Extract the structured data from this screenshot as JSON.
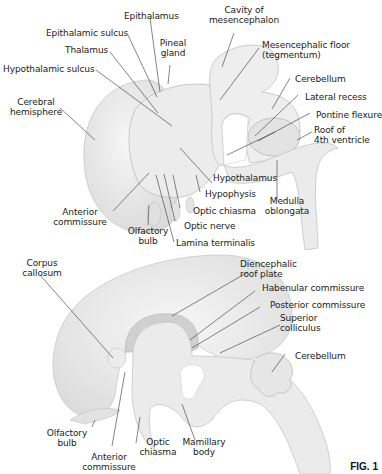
{
  "figure_number": "FIG. 1",
  "top_diagram": {
    "labels": [
      {
        "id": "epithalamus",
        "text": "Epithalamus"
      },
      {
        "id": "epithalamic_sulcus",
        "text": "Epithalamic sulcus"
      },
      {
        "id": "pineal_gland_1",
        "text": "Pineal"
      },
      {
        "id": "pineal_gland_2",
        "text": "gland"
      },
      {
        "id": "thalamus",
        "text": "Thalamus"
      },
      {
        "id": "hypothalamic_sulcus",
        "text": "Hypothalamic sulcus"
      },
      {
        "id": "cerebral_hemisphere_1",
        "text": "Cerebral"
      },
      {
        "id": "cerebral_hemisphere_2",
        "text": "hemisphere"
      },
      {
        "id": "cavity_mesencephalon_1",
        "text": "Cavity of"
      },
      {
        "id": "cavity_mesencephalon_2",
        "text": "mesencephalon"
      },
      {
        "id": "mesencephalic_floor_1",
        "text": "Mesencephalic floor"
      },
      {
        "id": "mesencephalic_floor_2",
        "text": "(tegmentum)"
      },
      {
        "id": "cerebellum",
        "text": "Cerebellum"
      },
      {
        "id": "lateral_recess",
        "text": "Lateral recess"
      },
      {
        "id": "pontine_flexure",
        "text": "Pontine flexure"
      },
      {
        "id": "roof_4th_1",
        "text": "Roof of"
      },
      {
        "id": "roof_4th_2",
        "text": "4th ventricle"
      },
      {
        "id": "hypothalamus",
        "text": "Hypothalamus"
      },
      {
        "id": "hypophysis",
        "text": "Hypophysis"
      },
      {
        "id": "medulla_1",
        "text": "Medulla"
      },
      {
        "id": "medulla_2",
        "text": "oblongata"
      },
      {
        "id": "optic_chiasma",
        "text": "Optic chiasma"
      },
      {
        "id": "optic_nerve",
        "text": "Optic nerve"
      },
      {
        "id": "anterior_commissure_1",
        "text": "Anterior"
      },
      {
        "id": "anterior_commissure_2",
        "text": "commissure"
      },
      {
        "id": "olfactory_bulb_1",
        "text": "Olfactory"
      },
      {
        "id": "olfactory_bulb_2",
        "text": "bulb"
      },
      {
        "id": "lamina_terminalis",
        "text": "Lamina terminalis"
      }
    ]
  },
  "bottom_diagram": {
    "labels": [
      {
        "id": "corpus_callosum_1",
        "text": "Corpus"
      },
      {
        "id": "corpus_callosum_2",
        "text": "callosum"
      },
      {
        "id": "diencephalic_roof_1",
        "text": "Diencephalic"
      },
      {
        "id": "diencephalic_roof_2",
        "text": "roof plate"
      },
      {
        "id": "habenular_commissure",
        "text": "Habenular commissure"
      },
      {
        "id": "posterior_commissure",
        "text": "Posterior commissure"
      },
      {
        "id": "superior_colliculus_1",
        "text": "Superior"
      },
      {
        "id": "superior_colliculus_2",
        "text": "colliculus"
      },
      {
        "id": "cerebellum",
        "text": "Cerebellum"
      },
      {
        "id": "olfactory_bulb_1",
        "text": "Olfactory"
      },
      {
        "id": "olfactory_bulb_2",
        "text": "bulb"
      },
      {
        "id": "anterior_commissure_1",
        "text": "Anterior"
      },
      {
        "id": "anterior_commissure_2",
        "text": "commissure"
      },
      {
        "id": "optic_chiasma_1",
        "text": "Optic"
      },
      {
        "id": "optic_chiasma_2",
        "text": "chiasma"
      },
      {
        "id": "mamillary_body_1",
        "text": "Mamillary"
      },
      {
        "id": "mamillary_body_2",
        "text": "body"
      }
    ]
  }
}
